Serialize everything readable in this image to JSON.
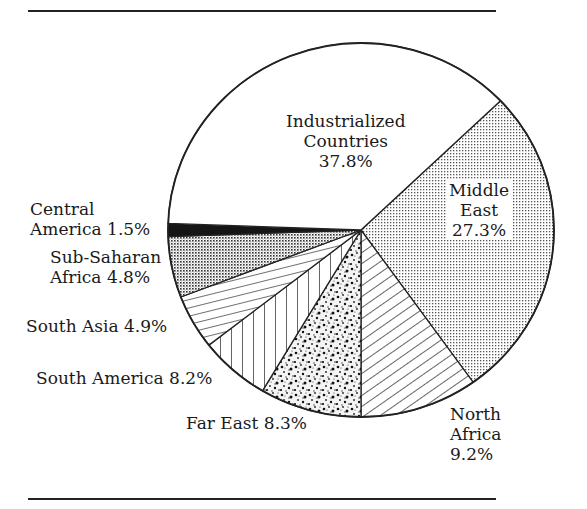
{
  "chart_data": {
    "type": "pie",
    "title": "",
    "slices": [
      {
        "label": "Industrialized Countries",
        "value": 37.8,
        "pattern": "blank"
      },
      {
        "label": "Middle East",
        "value": 27.3,
        "pattern": "fine-dot-grid"
      },
      {
        "label": "North Africa",
        "value": 9.2,
        "pattern": "diagonal-hatch"
      },
      {
        "label": "Far East",
        "value": 8.3,
        "pattern": "coarse-stipple"
      },
      {
        "label": "South America",
        "value": 8.2,
        "pattern": "vertical-lines"
      },
      {
        "label": "South Asia",
        "value": 4.9,
        "pattern": "near-horizontal-lines"
      },
      {
        "label": "Sub-Saharan Africa",
        "value": 4.8,
        "pattern": "cross-dot-grid"
      },
      {
        "label": "Central America",
        "value": 1.5,
        "pattern": "solid-black"
      }
    ],
    "unit": "%",
    "legend": "none (direct labels)"
  },
  "labels": {
    "industrialized": "Industrialized\nCountries\n37.8%",
    "middle_east": "Middle\nEast\n27.3%",
    "north_africa": "North\nAfrica\n9.2%",
    "far_east": "Far East 8.3%",
    "south_america": "South America 8.2%",
    "south_asia": "South Asia 4.9%",
    "sub_saharan": "Sub-Saharan\nAfrica 4.8%",
    "central_america": "Central\nAmerica 1.5%"
  },
  "geometry": {
    "cx": 361,
    "cy": 230,
    "rx": 193,
    "ry": 187,
    "boundaries_deg": [
      -43.7,
      54.5,
      90,
      120.7,
      142,
      159,
      178,
      182
    ]
  }
}
